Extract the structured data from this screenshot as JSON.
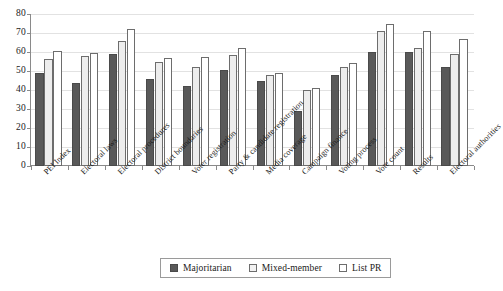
{
  "chart_data": {
    "type": "bar",
    "title": "",
    "subtitle": "",
    "xlabel": "",
    "ylabel": "",
    "ylim": [
      0,
      80
    ],
    "y_ticks": [
      0,
      10,
      20,
      30,
      40,
      50,
      60,
      70,
      80
    ],
    "grid": true,
    "legend_position": "bottom",
    "categories": [
      "PEI Index",
      "Electoral laws",
      "Electoral procedures",
      "District boundaries",
      "Voter registration",
      "Party & candidate registration",
      "Media coverage",
      "Campaign finance",
      "Voting process",
      "Vote count",
      "Results",
      "Electoral authorities"
    ],
    "series": [
      {
        "name": "Majoritarian",
        "color": "#595959",
        "values": [
          49,
          43.5,
          59,
          46,
          42,
          50.5,
          45,
          29,
          48,
          60,
          60,
          52
        ]
      },
      {
        "name": "Mixed-member",
        "color": "#ededed",
        "values": [
          56.5,
          58,
          66,
          55,
          52,
          58.5,
          48,
          40,
          52,
          71,
          62,
          59
        ]
      },
      {
        "name": "List PR",
        "color": "#ffffff",
        "values": [
          60.5,
          59.5,
          72,
          57,
          57.5,
          62,
          49,
          41,
          54,
          75,
          71,
          67
        ]
      }
    ]
  },
  "legend": {
    "items": [
      {
        "label": "Majoritarian",
        "swatch": "dark-gray-swatch"
      },
      {
        "label": "Mixed-member",
        "swatch": "light-gray-swatch"
      },
      {
        "label": "List PR",
        "swatch": "white-swatch"
      }
    ]
  },
  "axis": {
    "y_tick_labels": [
      "80",
      "70",
      "60",
      "50",
      "40",
      "30",
      "20",
      "10",
      "0"
    ]
  }
}
